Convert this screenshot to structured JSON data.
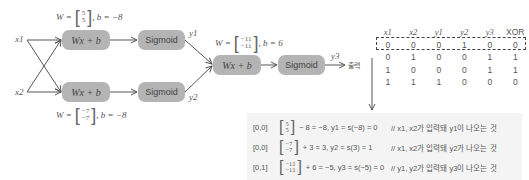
{
  "diagram": {
    "inputs": [
      "x1",
      "x2"
    ],
    "layer1": {
      "top": {
        "node_label": "Wx + b",
        "activation": "Sigmoid",
        "output": "y1",
        "weight_prefix": "W =",
        "weights": [
          "5",
          "5"
        ],
        "bias_text": ", b = −8"
      },
      "bottom": {
        "node_label": "Wx + b",
        "activation": "Sigmoid",
        "output": "y2",
        "weight_prefix": "W =",
        "weights": [
          "−7",
          "−7"
        ],
        "bias_text": ", b = −8"
      }
    },
    "layer2": {
      "node_label": "Wx + b",
      "activation": "Sigmoid",
      "output": "y3",
      "weight_prefix": "W =",
      "weights": [
        "−11",
        "−11"
      ],
      "bias_text": ", b = 6"
    },
    "output_label": "출력"
  },
  "truth_table": {
    "headers": [
      "x1",
      "x2",
      "y1",
      "y2",
      "y3",
      "XOR"
    ],
    "rows": [
      [
        "0",
        "0",
        "0",
        "1",
        "0",
        "0"
      ],
      [
        "0",
        "1",
        "0",
        "0",
        "1",
        "1"
      ],
      [
        "1",
        "0",
        "0",
        "0",
        "1",
        "1"
      ],
      [
        "1",
        "1",
        "1",
        "0",
        "0",
        "0"
      ]
    ],
    "highlighted_row": 0
  },
  "calculations": [
    {
      "point": "[0,0]",
      "vec": [
        "5",
        "5"
      ],
      "expr": "− 8 = −8,  y1 = s(−8) = 0",
      "comment": "// x1, x2가 입력돼 y1이 나오는 것"
    },
    {
      "point": "[0,0]",
      "vec": [
        "−7",
        "−7"
      ],
      "expr": "+ 3 = 3,  y2 = s(3) = 1",
      "comment": "// x1, x2가 입력돼 y2가 나오는 것"
    },
    {
      "point": "[0,1]",
      "vec": [
        "−11",
        "−11"
      ],
      "expr": "+ 6 = −5,  y3 = s(−5) = 0",
      "comment": "// y1, y2가 입력돼 y3이 나오는 것"
    }
  ]
}
